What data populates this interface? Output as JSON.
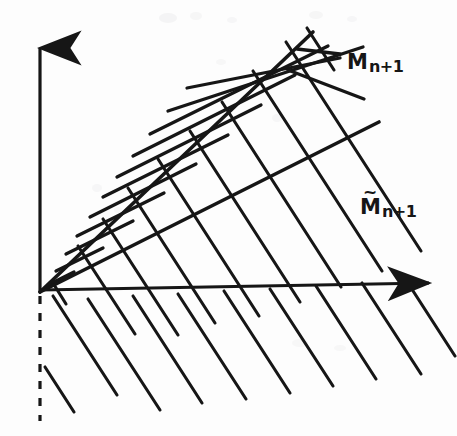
{
  "figure": {
    "width": 457,
    "height": 436,
    "background_color": "#fdfdfd",
    "ink_color": "#161616"
  },
  "axes": {
    "origin": {
      "x": 40,
      "y": 292
    },
    "vertical": {
      "name": "vertical-axis",
      "from": {
        "x": 40,
        "y": 292
      },
      "to": {
        "x": 40,
        "y": 38
      },
      "arrowhead": "up"
    },
    "horizontal": {
      "name": "horizontal-axis",
      "from": {
        "x": 40,
        "y": 290
      },
      "to": {
        "x": 437,
        "y": 282
      },
      "arrowhead": "right"
    },
    "dashed_below_origin": {
      "name": "dashed-vertical-below-origin",
      "from": {
        "x": 40,
        "y": 296
      },
      "to": {
        "x": 40,
        "y": 421
      },
      "style": "dashed"
    }
  },
  "rays": [
    {
      "id": "upper-ray",
      "label_ref": "M_{n+1}",
      "from": {
        "x": 40,
        "y": 292
      },
      "to": {
        "x": 313,
        "y": 32
      },
      "slope": -0.952
    },
    {
      "id": "lower-ray",
      "label_ref": "Mtilde_{n+1}",
      "from": {
        "x": 40,
        "y": 292
      },
      "to": {
        "x": 379,
        "y": 122
      },
      "slope": -0.502
    }
  ],
  "hatching": {
    "wedge_lines": {
      "name": "wedge-hatch-lines",
      "direction": "up-right",
      "count": 11,
      "slope": -0.502,
      "note": "parallel to the lower ray; fill the cone between the two rays and overshoot past the upper ray"
    },
    "sweep_lines": {
      "name": "down-right-sweep-lines",
      "direction": "down-right",
      "count": 10,
      "slope": 1.55,
      "note": "parallel family crossing the wedge and continuing below the horizontal axis"
    }
  },
  "labels": [
    {
      "id": "M_{n+1}",
      "name": "label-m-n-plus-1",
      "base": "M",
      "tilde": false,
      "subscript": "n+1",
      "x": 347,
      "y": 52
    },
    {
      "id": "Mtilde_{n+1}",
      "name": "label-m-tilde-n-plus-1",
      "base": "M",
      "tilde": true,
      "tilde_glyph": "~",
      "subscript": "n+1",
      "x": 360,
      "y": 197
    }
  ]
}
